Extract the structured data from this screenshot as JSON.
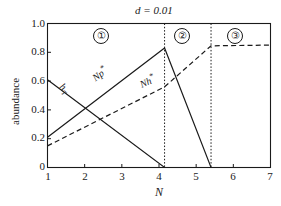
{
  "chart_data": {
    "type": "line",
    "title": "d = 0.01",
    "xlabel": "N",
    "ylabel": "abundance",
    "xlim": [
      1,
      7
    ],
    "ylim": [
      0,
      1.0
    ],
    "xticks": [
      "1",
      "2",
      "3",
      "4",
      "5",
      "6",
      "7"
    ],
    "xtick_values": [
      1,
      2,
      3,
      4,
      5,
      6,
      7
    ],
    "yticks": [
      "0",
      "0.2",
      "0.4",
      "0.6",
      "0.8",
      "1.0"
    ],
    "ytick_values": [
      0,
      0.2,
      0.4,
      0.6,
      0.8,
      1.0
    ],
    "grid": false,
    "legend": "inline-curve-labels",
    "series": [
      {
        "name": "h_T",
        "label": "hT",
        "style": "solid",
        "points": [
          [
            1,
            0.61
          ],
          [
            4.15,
            0.0
          ],
          [
            5.4,
            0.0
          ],
          [
            7,
            0.0
          ]
        ]
      },
      {
        "name": "Np*",
        "label": "Np*",
        "style": "solid",
        "points": [
          [
            1,
            0.21
          ],
          [
            4.15,
            0.83
          ],
          [
            5.4,
            0.0
          ],
          [
            7,
            0.0
          ]
        ]
      },
      {
        "name": "Nh*",
        "label": "Nh*",
        "style": "dashed",
        "points": [
          [
            1,
            0.15
          ],
          [
            4.15,
            0.56
          ],
          [
            5.4,
            0.845
          ],
          [
            7,
            0.85
          ]
        ]
      }
    ],
    "vertical_dividers": [
      4.15,
      5.4
    ],
    "regions": [
      {
        "badge": "①",
        "name": "region-1",
        "center_x": 2.6
      },
      {
        "badge": "②",
        "name": "region-2",
        "center_x": 4.78
      },
      {
        "badge": "③",
        "name": "region-3",
        "center_x": 6.2
      }
    ],
    "annotations": [
      {
        "text": "hT",
        "x": 1.75,
        "y": 0.49,
        "rotation": 40
      },
      {
        "text": "Np*",
        "x": 2.6,
        "y": 0.56,
        "rotation": -37
      },
      {
        "text": "Nh*",
        "x": 3.65,
        "y": 0.52,
        "rotation": -25
      }
    ],
    "colors": {
      "axis": "#1a1a1a",
      "solid_line": "#1a1a1a",
      "dashed_line": "#1a1a1a",
      "divider": "#1a1a1a",
      "background": "#ffffff"
    }
  }
}
